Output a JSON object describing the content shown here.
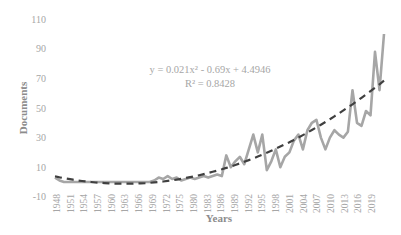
{
  "chart_data": {
    "type": "line",
    "title": "",
    "xlabel": "Years",
    "ylabel": "Documents",
    "ylim": [
      -10,
      110
    ],
    "yticks": [
      "110",
      "90",
      "70",
      "50",
      "30",
      "10",
      "-10"
    ],
    "xtick_labels": [
      "1948",
      "1951",
      "1954",
      "1957",
      "1960",
      "1963",
      "1966",
      "1969",
      "1972",
      "1975",
      "1980",
      "1983",
      "1986",
      "1989",
      "1992",
      "1995",
      "1998",
      "2001",
      "2004",
      "2007",
      "2010",
      "2013",
      "2016",
      "2019"
    ],
    "grid": false,
    "legend": "none",
    "x": [
      1948,
      1949,
      1950,
      1951,
      1952,
      1953,
      1954,
      1955,
      1956,
      1957,
      1958,
      1959,
      1960,
      1961,
      1962,
      1963,
      1964,
      1965,
      1966,
      1967,
      1968,
      1969,
      1970,
      1971,
      1972,
      1973,
      1974,
      1975,
      1976,
      1977,
      1978,
      1979,
      1980,
      1981,
      1982,
      1983,
      1984,
      1985,
      1986,
      1987,
      1988,
      1989,
      1990,
      1991,
      1992,
      1993,
      1994,
      1995,
      1996,
      1997,
      1998,
      1999,
      2000,
      2001,
      2002,
      2003,
      2004,
      2005,
      2006,
      2007,
      2008,
      2009,
      2010,
      2011,
      2012,
      2013,
      2014,
      2015,
      2016,
      2017,
      2018,
      2019,
      2020,
      2021
    ],
    "series": [
      {
        "name": "Documents",
        "color": "#a6a6a6",
        "values": [
          3,
          1,
          0,
          0,
          0,
          0,
          0,
          0,
          0,
          0,
          0,
          0,
          0,
          0,
          0,
          0,
          0,
          0,
          0,
          0,
          0,
          0,
          1,
          3,
          2,
          4,
          2,
          3,
          1,
          2,
          3,
          2,
          3,
          4,
          3,
          4,
          5,
          4,
          18,
          10,
          14,
          17,
          12,
          22,
          32,
          20,
          32,
          8,
          14,
          22,
          10,
          17,
          20,
          28,
          32,
          22,
          35,
          40,
          42,
          30,
          22,
          30,
          35,
          32,
          30,
          34,
          62,
          40,
          38,
          48,
          45,
          88,
          62,
          100
        ]
      },
      {
        "name": "Poly. (Documents)",
        "type": "trendline",
        "style": "dashed",
        "color": "#404040",
        "equation": "y = 0.021x² - 0.69x + 4.4946",
        "r_squared": "R² = 0.8428",
        "coefficients": {
          "a": 0.021,
          "b": -0.69,
          "c": 4.4946
        }
      }
    ],
    "annotations": [
      "y = 0.021x² - 0.69x + 4.4946",
      "R² = 0.8428"
    ]
  },
  "labels": {
    "ylabel": "Documents",
    "xlabel": "Years",
    "equation": "y = 0.021x² - 0.69x + 4.4946",
    "r_squared": "R² = 0.8428"
  }
}
